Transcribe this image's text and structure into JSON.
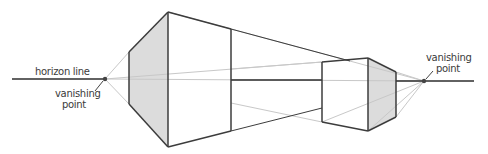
{
  "diagram": {
    "labels": {
      "horizon": "horizon line",
      "vp_left_line1": "vanishing",
      "vp_left_line2": "point",
      "vp_right_line1": "vanishing",
      "vp_right_line2": "point"
    },
    "colors": {
      "line_dark": "#3c3c3c",
      "line_light": "#c8c8c8",
      "shade": "#dcdcdc",
      "point": "#444444"
    }
  }
}
